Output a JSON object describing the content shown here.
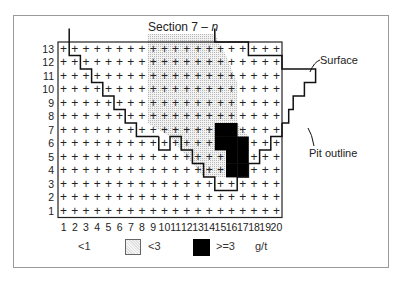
{
  "title": {
    "prefix": "Section 7 – ",
    "italic": "n"
  },
  "annotations": {
    "surface": "Surface",
    "pit_outline": "Pit outline"
  },
  "legend": {
    "items": [
      {
        "label": "<1",
        "swatch": "none"
      },
      {
        "label": "<3",
        "swatch": "dotted",
        "color": "#d8d8d8"
      },
      {
        "label": ">=3",
        "swatch": "solid",
        "color": "#000000"
      }
    ],
    "unit": "g/t"
  },
  "grid": {
    "columns": 20,
    "rows": 13,
    "x_labels": [
      "1",
      "2",
      "3",
      "4",
      "5",
      "6",
      "7",
      "8",
      "9",
      "10",
      "11",
      "12",
      "13",
      "14",
      "15",
      "16",
      "17",
      "18",
      "19",
      "20"
    ],
    "y_labels": [
      "13",
      "12",
      "11",
      "10",
      "9",
      "8",
      "7",
      "6",
      "5",
      "4",
      "3",
      "2",
      "1"
    ],
    "cell_marker": "+"
  },
  "chart_data": {
    "type": "heatmap",
    "title": "Section 7 – n",
    "xlabel": "Column",
    "ylabel": "Row",
    "x": [
      1,
      2,
      3,
      4,
      5,
      6,
      7,
      8,
      9,
      10,
      11,
      12,
      13,
      14,
      15,
      16,
      17,
      18,
      19,
      20
    ],
    "y": [
      1,
      2,
      3,
      4,
      5,
      6,
      7,
      8,
      9,
      10,
      11,
      12,
      13
    ],
    "classes": [
      "<1",
      "<3",
      ">=3"
    ],
    "unit": "g/t",
    "high_grade_cells_ge3": [
      [
        15,
        7
      ],
      [
        16,
        7
      ],
      [
        15,
        6
      ],
      [
        16,
        6
      ],
      [
        17,
        6
      ],
      [
        16,
        5
      ],
      [
        17,
        5
      ],
      [
        16,
        4
      ],
      [
        17,
        4
      ]
    ],
    "medium_grade_region_lt3": "rows 4-13, approximately columns 10-17, surrounding the >=3 block",
    "lines": [
      "Surface",
      "Pit outline"
    ]
  }
}
